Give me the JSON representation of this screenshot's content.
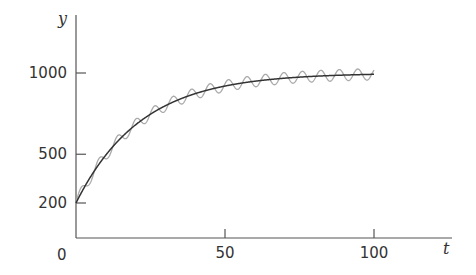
{
  "chart_data": {
    "type": "line",
    "title": "",
    "xlabel": "t",
    "ylabel": "y",
    "xlim": [
      0,
      105
    ],
    "ylim": [
      0,
      1100
    ],
    "x_ticks": [
      50,
      100
    ],
    "y_ticks": [
      200,
      500,
      1000
    ],
    "origin_label": "0",
    "grid": false,
    "legend": null,
    "series": [
      {
        "name": "smooth",
        "color": "#333333",
        "model": "y = 1000 - 800*exp(-0.046*t)",
        "x": [
          0,
          10,
          20,
          30,
          40,
          50,
          60,
          70,
          80,
          90,
          100
        ],
        "values": [
          200,
          495,
          681,
          799,
          873,
          920,
          949,
          968,
          980,
          987,
          992
        ]
      },
      {
        "name": "oscillating",
        "color": "#aaaaaa",
        "model": "y = 1000 - 800*exp(-0.046*t) + 35*sin(2*pi*t/6.2)",
        "amplitude": 35,
        "period": 6.2,
        "x_range": [
          0,
          100
        ]
      }
    ]
  }
}
